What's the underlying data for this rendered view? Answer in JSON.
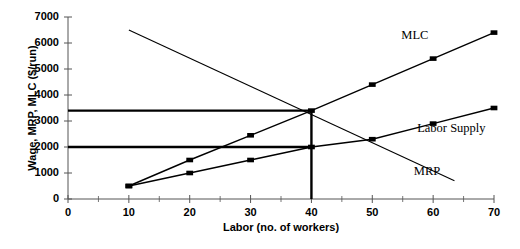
{
  "chart_data": {
    "type": "line",
    "title": "",
    "xlabel": "Labor (no. of workers)",
    "ylabel": "Wage, MRP, MLC ($/run)",
    "xlim": [
      0,
      70
    ],
    "ylim": [
      0,
      7000
    ],
    "xticks": [
      0,
      10,
      20,
      30,
      40,
      50,
      60,
      70
    ],
    "xtick_labels": [
      "0",
      "10",
      "20",
      "30",
      "40",
      "50",
      "60",
      "70"
    ],
    "xminor_ticks": [
      5,
      15,
      25,
      35,
      45,
      55,
      65
    ],
    "yticks": [
      0,
      1000,
      2000,
      3000,
      4000,
      5000,
      6000,
      7000
    ],
    "ytick_labels": [
      "0",
      "1000",
      "2000",
      "3000",
      "4000",
      "5000",
      "6000",
      "7000"
    ],
    "grid": false,
    "legend_position": "inline-annotations",
    "series": [
      {
        "name": "MLC",
        "label": "MLC",
        "label_x": 57,
        "label_y": 6250,
        "markers": true,
        "x": [
          10,
          20,
          30,
          40,
          50,
          60,
          70
        ],
        "values": [
          500,
          1500,
          2450,
          3400,
          4400,
          5400,
          6400
        ]
      },
      {
        "name": "Labor Supply",
        "label": "Labor Supply",
        "label_x": 63,
        "label_y": 2700,
        "markers": true,
        "x": [
          10,
          20,
          30,
          40,
          50,
          60,
          70
        ],
        "values": [
          500,
          1000,
          1500,
          2000,
          2300,
          2900,
          3500
        ]
      },
      {
        "name": "MRP",
        "label": "MRP",
        "label_x": 59,
        "label_y": 1050,
        "markers": false,
        "x": [
          10,
          63.5
        ],
        "values": [
          6500,
          700
        ]
      }
    ],
    "annotations": [
      {
        "name": "equilibrium-reference-upper",
        "type": "horizontal-line",
        "y": 3400,
        "x_from": 0,
        "x_to": 40,
        "note": "MLC = MRP intersection wage level"
      },
      {
        "name": "supply-reference-lower",
        "type": "horizontal-line",
        "y": 2000,
        "x_from": 0,
        "x_to": 40,
        "note": "Wage paid from labor supply curve"
      },
      {
        "name": "quantity-reference",
        "type": "vertical-line",
        "x": 40,
        "y_from": 0,
        "y_to": 3400,
        "note": "Equilibrium quantity of labor"
      }
    ]
  }
}
